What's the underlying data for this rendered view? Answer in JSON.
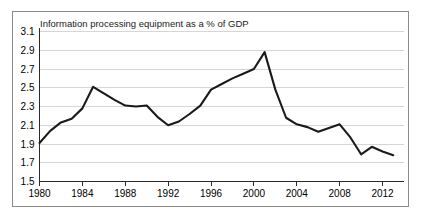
{
  "chart_data": {
    "type": "line",
    "title": "Information processing equipment as a % of GDP",
    "xlabel": "",
    "ylabel": "",
    "xlim": [
      1980,
      2014
    ],
    "ylim": [
      1.5,
      3.1
    ],
    "ytick_step": 0.2,
    "grid": true,
    "legend": null,
    "legend_position": "none",
    "xticks": [
      "1980",
      "1984",
      "1988",
      "1992",
      "1996",
      "2000",
      "2004",
      "2008",
      "2012"
    ],
    "xtick_values": [
      1980,
      1984,
      1988,
      1992,
      1996,
      2000,
      2004,
      2008,
      2012
    ],
    "yticks": [
      "1.5",
      "1.7",
      "1.9",
      "2.1",
      "2.3",
      "2.5",
      "2.7",
      "2.9",
      "3.1"
    ],
    "ytick_values": [
      1.5,
      1.7,
      1.9,
      2.1,
      2.3,
      2.5,
      2.7,
      2.9,
      3.1
    ],
    "x": [
      1980,
      1981,
      1982,
      1983,
      1984,
      1985,
      1986,
      1987,
      1988,
      1989,
      1990,
      1991,
      1992,
      1993,
      1994,
      1995,
      1996,
      1997,
      1998,
      1999,
      2000,
      2001,
      2002,
      2003,
      2004,
      2005,
      2006,
      2007,
      2008,
      2009,
      2010,
      2011,
      2012,
      2013
    ],
    "values": [
      1.91,
      2.04,
      2.13,
      2.17,
      2.28,
      2.51,
      2.44,
      2.37,
      2.31,
      2.3,
      2.31,
      2.19,
      2.1,
      2.14,
      2.22,
      2.31,
      2.48,
      2.54,
      2.6,
      2.65,
      2.7,
      2.88,
      2.48,
      2.18,
      2.11,
      2.08,
      2.03,
      2.07,
      2.11,
      1.97,
      1.79,
      1.87,
      1.82,
      1.78
    ],
    "series_color": "#1a1a1a",
    "grid_color": "#d6d6d6",
    "axis_color": "#2b2b2b",
    "frame_color": "#8a8a8a",
    "background_color": "#ffffff"
  }
}
